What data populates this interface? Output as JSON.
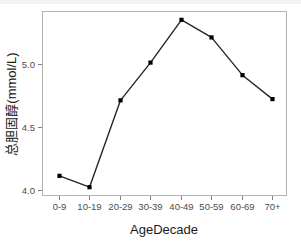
{
  "chart_data": {
    "type": "line",
    "title": "",
    "subtitle": "",
    "xlabel": "AgeDecade",
    "ylabel": "总胆固醇(mmol/L)",
    "categories": [
      "0-9",
      "10-19",
      "20-29",
      "30-39",
      "40-49",
      "50-59",
      "60-69",
      "70+"
    ],
    "values": [
      4.09,
      4.0,
      4.69,
      4.99,
      5.33,
      5.19,
      4.89,
      4.7
    ],
    "series": [
      {
        "name": "总胆固醇",
        "values": [
          4.09,
          4.0,
          4.69,
          4.99,
          5.33,
          5.19,
          4.89,
          4.7
        ]
      }
    ],
    "ylim": [
      3.93,
      5.4
    ],
    "yticks": [
      4.0,
      4.5,
      5.0
    ],
    "ytick_labels": [
      "4.0",
      "4.5",
      "5.0"
    ],
    "grid": false,
    "legend": "none",
    "line_color": "#262626",
    "point_color": "#000000",
    "point_shape": "square",
    "panel_background": "#ffffff",
    "panel_border_color": "#b3b3b3",
    "axis_text_color": "#4d4d4d",
    "axis_title_color": "#1a1a1a"
  },
  "axes": {
    "x_title": "AgeDecade",
    "y_title": "总胆固醇(mmol/L)",
    "x_tick_labels": [
      "0-9",
      "10-19",
      "20-29",
      "30-39",
      "40-49",
      "50-59",
      "60-69",
      "70+"
    ],
    "y_tick_labels": [
      "4.0",
      "4.5",
      "5.0"
    ]
  }
}
